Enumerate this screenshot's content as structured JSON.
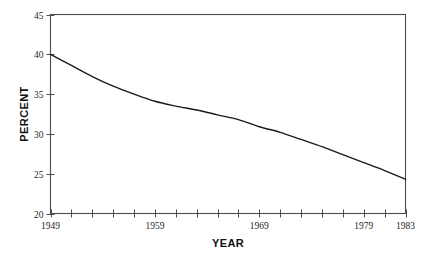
{
  "chart_data": {
    "type": "line",
    "title": "",
    "xlabel": "YEAR",
    "ylabel": "PERCENT",
    "xlim": [
      1949,
      1983
    ],
    "ylim": [
      20,
      45
    ],
    "grid": false,
    "legend": null,
    "x_tick_labels": [
      "1949",
      "1959",
      "1969",
      "1979",
      "1983"
    ],
    "x_tick_label_values": [
      1949,
      1959,
      1969,
      1979,
      1983
    ],
    "x_minor_tick_values": [
      1949,
      1951,
      1953,
      1955,
      1957,
      1959,
      1961,
      1963,
      1965,
      1967,
      1969,
      1971,
      1973,
      1975,
      1977,
      1979,
      1981,
      1983
    ],
    "y_tick_labels": [
      "20",
      "25",
      "30",
      "35",
      "40",
      "45"
    ],
    "y_tick_values": [
      20,
      25,
      30,
      35,
      40,
      45
    ],
    "series": [
      {
        "name": "Percent",
        "x": [
          1949,
          1951,
          1953,
          1955,
          1957,
          1959,
          1961,
          1963,
          1965,
          1967,
          1969,
          1971,
          1973,
          1975,
          1977,
          1979,
          1981,
          1983
        ],
        "values": [
          40.0,
          38.6,
          37.2,
          36.0,
          35.0,
          34.1,
          33.5,
          33.0,
          32.4,
          31.8,
          30.9,
          30.2,
          29.3,
          28.4,
          27.4,
          26.4,
          25.4,
          24.3
        ]
      }
    ]
  },
  "axes": {
    "y_axis_title": "PERCENT",
    "x_axis_title": "YEAR"
  },
  "colors": {
    "line": "#1a1a1a",
    "frame": "#4d4d4d",
    "background": "#ffffff",
    "text": "#262626"
  }
}
